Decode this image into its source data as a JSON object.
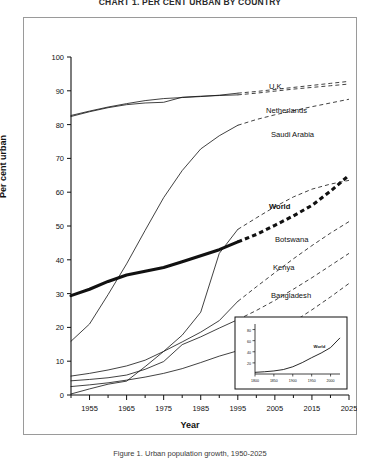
{
  "title": "CHART 1. PER CENT URBAN BY COUNTRY",
  "caption": "Figure 1. Urban population growth, 1950-2025",
  "axes": {
    "ylabel": "Per cent urban",
    "xlabel": "Year",
    "yticks": [
      "0",
      "10",
      "20",
      "30",
      "40",
      "50",
      "60",
      "70",
      "80",
      "90",
      "100"
    ],
    "xticks": [
      "1955",
      "1965",
      "1975",
      "1985",
      "1995",
      "2005",
      "2015",
      "2025"
    ]
  },
  "inset": {
    "series_label": "World",
    "xticks": [
      "1800",
      "1850",
      "1900",
      "1950",
      "2000"
    ],
    "yticks": [
      "20",
      "40",
      "60",
      "80"
    ]
  },
  "chart_data": {
    "type": "line",
    "title": "CHART 1. PER CENT URBAN BY COUNTRY",
    "xlabel": "Year",
    "ylabel": "Per cent urban",
    "xlim": [
      1950,
      2025
    ],
    "ylim": [
      0,
      100
    ],
    "grid": false,
    "legend": "inline-right-labels",
    "observed_range": [
      1950,
      1995
    ],
    "projected_range": [
      1995,
      2025
    ],
    "x": [
      1950,
      1955,
      1960,
      1965,
      1970,
      1975,
      1980,
      1985,
      1990,
      1995,
      2000,
      2005,
      2010,
      2015,
      2020,
      2025
    ],
    "series": [
      {
        "name": "U.K.",
        "style": "thin",
        "values": [
          82.7,
          84.0,
          85.2,
          86.2,
          87.1,
          87.7,
          88.0,
          88.3,
          88.7,
          89.3,
          89.8,
          90.4,
          91.0,
          91.6,
          92.2,
          92.8
        ]
      },
      {
        "name": "Netherlands",
        "style": "thin",
        "values": [
          82.4,
          83.8,
          85.0,
          85.9,
          86.4,
          86.6,
          88.1,
          88.4,
          88.6,
          88.8,
          89.3,
          89.9,
          90.5,
          91.0,
          91.5,
          92.0
        ]
      },
      {
        "name": "Saudi Arabia",
        "style": "thin",
        "values": [
          15.9,
          21.0,
          29.7,
          38.8,
          48.7,
          58.4,
          66.4,
          72.8,
          76.7,
          79.8,
          81.5,
          82.9,
          84.1,
          85.3,
          86.4,
          87.5
        ]
      },
      {
        "name": "World",
        "style": "bold",
        "values": [
          29.4,
          31.3,
          33.6,
          35.5,
          36.6,
          37.7,
          39.4,
          41.2,
          43.0,
          45.3,
          47.5,
          50.2,
          53.0,
          56.1,
          60.3,
          65.0
        ]
      },
      {
        "name": "Botswana",
        "style": "thin",
        "values": [
          0.3,
          1.8,
          3.2,
          4.1,
          8.4,
          12.9,
          17.7,
          24.5,
          41.9,
          49.0,
          52.4,
          55.7,
          58.6,
          60.9,
          62.4,
          63.5
        ]
      },
      {
        "name": "Kenya",
        "style": "thin",
        "values": [
          5.6,
          6.4,
          7.4,
          8.6,
          10.3,
          12.9,
          15.7,
          18.6,
          22.0,
          27.7,
          32.0,
          36.2,
          40.3,
          44.2,
          47.9,
          51.3
        ]
      },
      {
        "name": "Bangladesh",
        "style": "thin",
        "values": [
          4.2,
          4.6,
          5.1,
          5.9,
          7.6,
          9.9,
          14.9,
          17.2,
          19.8,
          22.3,
          25.0,
          28.0,
          31.3,
          34.7,
          38.3,
          41.9
        ]
      },
      {
        "name": "Oman",
        "style": "thin",
        "values": [
          2.5,
          3.0,
          3.6,
          4.4,
          5.3,
          6.4,
          7.8,
          9.6,
          11.5,
          13.1,
          15.4,
          18.3,
          21.6,
          25.2,
          29.0,
          33.0
        ]
      }
    ],
    "inset_chart": {
      "type": "line",
      "title": "",
      "xlabel": "",
      "ylabel": "",
      "xlim": [
        1800,
        2025
      ],
      "ylim": [
        0,
        90
      ],
      "series_name": "World",
      "x": [
        1800,
        1825,
        1850,
        1875,
        1900,
        1925,
        1950,
        1975,
        2000,
        2025
      ],
      "values": [
        3.0,
        4.0,
        5.5,
        8.0,
        13.0,
        20.5,
        29.4,
        37.7,
        47.5,
        65.0
      ]
    }
  }
}
